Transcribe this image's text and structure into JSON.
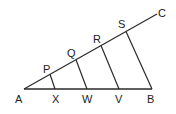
{
  "diagram": {
    "type": "geometry-transversals",
    "background": "#ffffff",
    "stroke_color": "#2a2a2a",
    "points": {
      "A": {
        "label": "A",
        "x": 24,
        "y": 89
      },
      "B": {
        "label": "B",
        "x": 152,
        "y": 89
      },
      "C": {
        "label": "C",
        "x": 157,
        "y": 14
      },
      "P": {
        "label": "P",
        "x": 50,
        "y": 74
      },
      "Q": {
        "label": "Q",
        "x": 76,
        "y": 59
      },
      "R": {
        "label": "R",
        "x": 101,
        "y": 45
      },
      "S": {
        "label": "S",
        "x": 126,
        "y": 30
      },
      "X": {
        "label": "X",
        "x": 55,
        "y": 89
      },
      "W": {
        "label": "W",
        "x": 87,
        "y": 89
      },
      "V": {
        "label": "V",
        "x": 119,
        "y": 89
      }
    },
    "segments": [
      {
        "from": "A",
        "to": "B"
      },
      {
        "from": "A",
        "to": "C"
      },
      {
        "from": "P",
        "to": "X"
      },
      {
        "from": "Q",
        "to": "W"
      },
      {
        "from": "R",
        "to": "V"
      },
      {
        "from": "S",
        "to": "B"
      }
    ],
    "labels": {
      "A": "A",
      "B": "B",
      "C": "C",
      "P": "P",
      "Q": "Q",
      "R": "R",
      "S": "S",
      "X": "X",
      "W": "W",
      "V": "V"
    }
  }
}
